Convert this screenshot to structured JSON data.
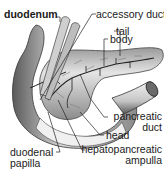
{
  "diagram": {
    "labels": {
      "duodenum": "duodenum",
      "accessory_duct": "accessory duct",
      "tail": "tail",
      "body": "body",
      "pancreatic_duct_line1": "pancreatic",
      "pancreatic_duct_line2": "duct",
      "head": "head",
      "duodenal_papilla_line1": "duodenal",
      "duodenal_papilla_line2": "papilla",
      "hepatopancreatic_ampulla_line1": "hepatopancreatic",
      "hepatopancreatic_ampulla_line2": "ampulla"
    },
    "colors": {
      "line": "#222222",
      "organ_light": "#e6e6e6",
      "organ_mid": "#b0b0b0",
      "organ_dark": "#555555"
    }
  }
}
